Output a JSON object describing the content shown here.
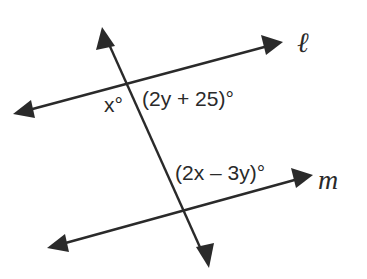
{
  "diagram": {
    "type": "parallel-lines-transversal",
    "colors": {
      "stroke": "#2a2a2a",
      "background": "#ffffff"
    },
    "lines": {
      "l": {
        "name": "ℓ",
        "from": [
          13,
          114
        ],
        "to": [
          283,
          42
        ]
      },
      "m": {
        "name": "m",
        "from": [
          47,
          248
        ],
        "to": [
          313,
          175
        ]
      },
      "transversal": {
        "name": "",
        "from": [
          209,
          268
        ],
        "to": [
          102,
          27
        ]
      }
    },
    "intersections": {
      "transversal_l": [
        127,
        82
      ],
      "transversal_m": [
        183,
        212
      ]
    },
    "angle_labels": {
      "x": "x°",
      "upper_right": "(2y + 25)°",
      "lower": "(2x – 3y)°"
    }
  }
}
